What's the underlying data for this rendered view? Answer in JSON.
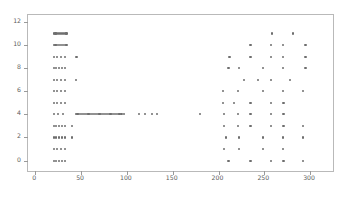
{
  "chart_data": {
    "type": "scatter",
    "title": "",
    "xlabel": "",
    "ylabel": "",
    "xlim": [
      -8,
      325
    ],
    "ylim": [
      -0.9,
      12.6
    ],
    "xticks": [
      0,
      50,
      100,
      150,
      200,
      250,
      300
    ],
    "yticks": [
      0,
      2,
      4,
      6,
      8,
      10,
      12
    ],
    "xtick_labels": [
      "0",
      "50",
      "100",
      "150",
      "200",
      "250",
      "300"
    ],
    "ytick_labels": [
      "0",
      "2",
      "4",
      "6",
      "8",
      "10",
      "12"
    ],
    "grid": false,
    "legend": null,
    "marker_color": "#6e6e6e",
    "marker_size": 2.2,
    "frame_color": "#b9b9b9",
    "background": "#ffffff",
    "series": [
      {
        "name": "observations",
        "x": [
          20,
          22,
          24,
          26,
          28,
          30,
          32,
          34,
          20,
          22,
          24,
          26,
          28,
          30,
          32,
          34,
          20,
          24,
          28,
          32,
          45,
          20,
          23,
          26,
          29,
          32,
          20,
          24,
          28,
          32,
          44,
          20,
          24,
          28,
          32,
          20,
          24,
          28,
          32,
          20,
          25,
          30,
          44,
          46,
          48,
          50,
          52,
          54,
          56,
          58,
          60,
          62,
          64,
          66,
          68,
          70,
          72,
          74,
          76,
          78,
          80,
          82,
          84,
          86,
          88,
          90,
          92,
          94,
          97,
          113,
          120,
          127,
          133,
          180,
          20,
          23,
          26,
          29,
          32,
          40,
          20,
          23,
          26,
          29,
          32,
          40,
          20,
          24,
          28,
          32,
          20,
          23,
          26,
          29,
          32,
          258,
          281,
          235,
          257,
          270,
          295,
          212,
          235,
          257,
          270,
          295,
          211,
          222,
          249,
          270,
          295,
          228,
          243,
          257,
          278,
          205,
          221,
          249,
          270,
          292,
          205,
          217,
          235,
          257,
          271,
          206,
          221,
          235,
          257,
          271,
          206,
          221,
          235,
          257,
          271,
          292,
          208,
          222,
          249,
          270,
          292,
          206,
          222,
          249,
          270,
          211,
          235,
          257,
          271,
          292
        ],
        "y": [
          11,
          11,
          11,
          11,
          11,
          11,
          11,
          11,
          10,
          10,
          10,
          10,
          10,
          10,
          10,
          10,
          9,
          9,
          9,
          9,
          9,
          8,
          8,
          8,
          8,
          8,
          7,
          7,
          7,
          7,
          7,
          6,
          6,
          6,
          6,
          5,
          5,
          5,
          5,
          4,
          4,
          4,
          4,
          4,
          4,
          4,
          4,
          4,
          4,
          4,
          4,
          4,
          4,
          4,
          4,
          4,
          4,
          4,
          4,
          4,
          4,
          4,
          4,
          4,
          4,
          4,
          4,
          4,
          4,
          4,
          4,
          4,
          4,
          4,
          3,
          3,
          3,
          3,
          3,
          3,
          2,
          2,
          2,
          2,
          2,
          2,
          1,
          1,
          1,
          1,
          0,
          0,
          0,
          0,
          0,
          11,
          11,
          10,
          10,
          10,
          10,
          9,
          9,
          9,
          9,
          9,
          8,
          8,
          8,
          8,
          8,
          7,
          7,
          7,
          7,
          6,
          6,
          6,
          6,
          6,
          5,
          5,
          5,
          5,
          5,
          4,
          4,
          4,
          4,
          4,
          3,
          3,
          3,
          3,
          3,
          3,
          2,
          2,
          2,
          2,
          2,
          1,
          1,
          1,
          1,
          0,
          0,
          0,
          0,
          0
        ]
      }
    ]
  }
}
